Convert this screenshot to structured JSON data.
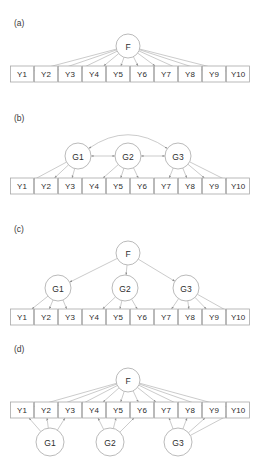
{
  "figure": {
    "width": 261,
    "height": 472,
    "background": "#ffffff",
    "line_color": "#a8a8a8",
    "text_color": "#2e2e2e",
    "box_fill": "#ffffff"
  },
  "panels": [
    {
      "id": "a",
      "label": "(a)",
      "label_pos": {
        "x": 14,
        "y": 26
      },
      "model_name": "unidimensional-model",
      "latents": [
        {
          "name": "F",
          "cx": 128,
          "cy": 46,
          "r": 12
        }
      ],
      "observed": [
        {
          "name": "Y1",
          "cx": 22,
          "cy": 74
        },
        {
          "name": "Y2",
          "cx": 46,
          "cy": 74
        },
        {
          "name": "Y3",
          "cx": 70,
          "cy": 74
        },
        {
          "name": "Y4",
          "cx": 94,
          "cy": 74
        },
        {
          "name": "Y5",
          "cx": 118,
          "cy": 74
        },
        {
          "name": "Y6",
          "cx": 142,
          "cy": 74
        },
        {
          "name": "Y7",
          "cx": 166,
          "cy": 74
        },
        {
          "name": "Y8",
          "cx": 190,
          "cy": 74
        },
        {
          "name": "Y9",
          "cx": 214,
          "cy": 74
        },
        {
          "name": "Y10",
          "cx": 238,
          "cy": 74
        }
      ],
      "edges": [
        {
          "from": "F",
          "to": "Y1",
          "type": "directed"
        },
        {
          "from": "F",
          "to": "Y2",
          "type": "directed"
        },
        {
          "from": "F",
          "to": "Y3",
          "type": "directed"
        },
        {
          "from": "F",
          "to": "Y4",
          "type": "directed"
        },
        {
          "from": "F",
          "to": "Y5",
          "type": "directed"
        },
        {
          "from": "F",
          "to": "Y6",
          "type": "directed"
        },
        {
          "from": "F",
          "to": "Y7",
          "type": "directed"
        },
        {
          "from": "F",
          "to": "Y8",
          "type": "directed"
        },
        {
          "from": "F",
          "to": "Y9",
          "type": "directed"
        },
        {
          "from": "F",
          "to": "Y10",
          "type": "directed"
        }
      ]
    },
    {
      "id": "b",
      "label": "(b)",
      "label_pos": {
        "x": 14,
        "y": 121
      },
      "model_name": "correlated-factors-model",
      "latents": [
        {
          "name": "G1",
          "cx": 78,
          "cy": 156,
          "r": 13
        },
        {
          "name": "G2",
          "cx": 128,
          "cy": 156,
          "r": 13
        },
        {
          "name": "G3",
          "cx": 178,
          "cy": 156,
          "r": 13
        }
      ],
      "observed": [
        {
          "name": "Y1",
          "cx": 22,
          "cy": 186
        },
        {
          "name": "Y2",
          "cx": 46,
          "cy": 186
        },
        {
          "name": "Y3",
          "cx": 70,
          "cy": 186
        },
        {
          "name": "Y4",
          "cx": 94,
          "cy": 186
        },
        {
          "name": "Y5",
          "cx": 118,
          "cy": 186
        },
        {
          "name": "Y6",
          "cx": 142,
          "cy": 186
        },
        {
          "name": "Y7",
          "cx": 166,
          "cy": 186
        },
        {
          "name": "Y8",
          "cx": 190,
          "cy": 186
        },
        {
          "name": "Y9",
          "cx": 214,
          "cy": 186
        },
        {
          "name": "Y10",
          "cx": 238,
          "cy": 186
        }
      ],
      "edges": [
        {
          "from": "G1",
          "to": "Y1",
          "type": "directed"
        },
        {
          "from": "G1",
          "to": "Y2",
          "type": "directed"
        },
        {
          "from": "G1",
          "to": "Y3",
          "type": "directed"
        },
        {
          "from": "G2",
          "to": "Y4",
          "type": "directed"
        },
        {
          "from": "G2",
          "to": "Y5",
          "type": "directed"
        },
        {
          "from": "G2",
          "to": "Y6",
          "type": "directed"
        },
        {
          "from": "G3",
          "to": "Y7",
          "type": "directed"
        },
        {
          "from": "G3",
          "to": "Y8",
          "type": "directed"
        },
        {
          "from": "G3",
          "to": "Y9",
          "type": "directed"
        },
        {
          "from": "G3",
          "to": "Y10",
          "type": "directed"
        },
        {
          "from": "G1",
          "to": "G2",
          "type": "bidirected"
        },
        {
          "from": "G2",
          "to": "G3",
          "type": "bidirected"
        },
        {
          "from": "G1",
          "to": "G3",
          "type": "bidirected-arc"
        }
      ]
    },
    {
      "id": "c",
      "label": "(c)",
      "label_pos": {
        "x": 14,
        "y": 232
      },
      "model_name": "second-order-factor-model",
      "latents": [
        {
          "name": "F",
          "cx": 128,
          "cy": 253,
          "r": 12
        },
        {
          "name": "G1",
          "cx": 58,
          "cy": 288,
          "r": 13
        },
        {
          "name": "G2",
          "cx": 125,
          "cy": 288,
          "r": 13
        },
        {
          "name": "G3",
          "cx": 186,
          "cy": 288,
          "r": 13
        }
      ],
      "observed": [
        {
          "name": "Y1",
          "cx": 22,
          "cy": 317
        },
        {
          "name": "Y2",
          "cx": 46,
          "cy": 317
        },
        {
          "name": "Y3",
          "cx": 70,
          "cy": 317
        },
        {
          "name": "Y4",
          "cx": 94,
          "cy": 317
        },
        {
          "name": "Y5",
          "cx": 118,
          "cy": 317
        },
        {
          "name": "Y6",
          "cx": 142,
          "cy": 317
        },
        {
          "name": "Y7",
          "cx": 166,
          "cy": 317
        },
        {
          "name": "Y8",
          "cx": 190,
          "cy": 317
        },
        {
          "name": "Y9",
          "cx": 214,
          "cy": 317
        },
        {
          "name": "Y10",
          "cx": 238,
          "cy": 317
        }
      ],
      "edges": [
        {
          "from": "F",
          "to": "G1",
          "type": "directed"
        },
        {
          "from": "F",
          "to": "G2",
          "type": "directed"
        },
        {
          "from": "F",
          "to": "G3",
          "type": "directed"
        },
        {
          "from": "G1",
          "to": "Y1",
          "type": "directed"
        },
        {
          "from": "G1",
          "to": "Y2",
          "type": "directed"
        },
        {
          "from": "G1",
          "to": "Y3",
          "type": "directed"
        },
        {
          "from": "G2",
          "to": "Y4",
          "type": "directed"
        },
        {
          "from": "G2",
          "to": "Y5",
          "type": "directed"
        },
        {
          "from": "G2",
          "to": "Y6",
          "type": "directed"
        },
        {
          "from": "G3",
          "to": "Y7",
          "type": "directed"
        },
        {
          "from": "G3",
          "to": "Y8",
          "type": "directed"
        },
        {
          "from": "G3",
          "to": "Y9",
          "type": "directed"
        },
        {
          "from": "G3",
          "to": "Y10",
          "type": "directed"
        }
      ]
    },
    {
      "id": "d",
      "label": "(d)",
      "label_pos": {
        "x": 14,
        "y": 352
      },
      "model_name": "bifactor-model",
      "latents": [
        {
          "name": "F",
          "cx": 128,
          "cy": 380,
          "r": 12
        },
        {
          "name": "G1",
          "cx": 50,
          "cy": 442,
          "r": 14
        },
        {
          "name": "G2",
          "cx": 110,
          "cy": 442,
          "r": 14
        },
        {
          "name": "G3",
          "cx": 178,
          "cy": 442,
          "r": 14
        }
      ],
      "observed": [
        {
          "name": "Y1",
          "cx": 22,
          "cy": 410
        },
        {
          "name": "Y2",
          "cx": 46,
          "cy": 410
        },
        {
          "name": "Y3",
          "cx": 70,
          "cy": 410
        },
        {
          "name": "Y4",
          "cx": 94,
          "cy": 410
        },
        {
          "name": "Y5",
          "cx": 118,
          "cy": 410
        },
        {
          "name": "Y6",
          "cx": 142,
          "cy": 410
        },
        {
          "name": "Y7",
          "cx": 166,
          "cy": 410
        },
        {
          "name": "Y8",
          "cx": 190,
          "cy": 410
        },
        {
          "name": "Y9",
          "cx": 214,
          "cy": 410
        },
        {
          "name": "Y10",
          "cx": 238,
          "cy": 410
        }
      ],
      "edges": [
        {
          "from": "F",
          "to": "Y1",
          "type": "directed"
        },
        {
          "from": "F",
          "to": "Y2",
          "type": "directed"
        },
        {
          "from": "F",
          "to": "Y3",
          "type": "directed"
        },
        {
          "from": "F",
          "to": "Y4",
          "type": "directed"
        },
        {
          "from": "F",
          "to": "Y5",
          "type": "directed"
        },
        {
          "from": "F",
          "to": "Y6",
          "type": "directed"
        },
        {
          "from": "F",
          "to": "Y7",
          "type": "directed"
        },
        {
          "from": "F",
          "to": "Y8",
          "type": "directed"
        },
        {
          "from": "F",
          "to": "Y9",
          "type": "directed"
        },
        {
          "from": "F",
          "to": "Y10",
          "type": "directed"
        },
        {
          "from": "G1",
          "to": "Y1",
          "type": "directed"
        },
        {
          "from": "G1",
          "to": "Y2",
          "type": "directed"
        },
        {
          "from": "G1",
          "to": "Y3",
          "type": "directed"
        },
        {
          "from": "G2",
          "to": "Y4",
          "type": "directed"
        },
        {
          "from": "G2",
          "to": "Y5",
          "type": "directed"
        },
        {
          "from": "G2",
          "to": "Y6",
          "type": "directed"
        },
        {
          "from": "G3",
          "to": "Y7",
          "type": "directed"
        },
        {
          "from": "G3",
          "to": "Y8",
          "type": "directed"
        },
        {
          "from": "G3",
          "to": "Y9",
          "type": "directed"
        },
        {
          "from": "G3",
          "to": "Y10",
          "type": "directed"
        }
      ]
    }
  ],
  "geometry": {
    "box_width": 23,
    "box_height": 16
  }
}
